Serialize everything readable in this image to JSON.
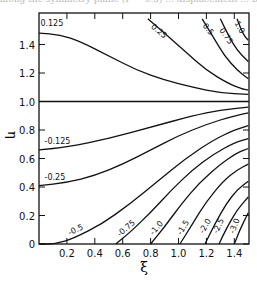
{
  "caption_fragment": "along the symmetry plane (Γ = 0.5) ... displacement ... by",
  "chart_data": {
    "type": "line",
    "title": "",
    "xlabel": "ξ",
    "ylabel": "η",
    "xlim": [
      0,
      1.5
    ],
    "ylim": [
      0,
      1.62
    ],
    "grid": false,
    "legend": "none (inline contour labels)",
    "xticks": [
      0.2,
      0.4,
      0.6,
      0.8,
      1.0,
      1.2,
      1.4
    ],
    "xtick_labels": [
      "0.2",
      "0.4",
      "0.6",
      "0.8",
      "1.0",
      "1.2",
      "1.4"
    ],
    "yticks": [
      0,
      0.2,
      0.4,
      0.6,
      0.8,
      1.0,
      1.2,
      1.4
    ],
    "ytick_labels": [
      "0",
      "0.2",
      "0.4",
      "0.6",
      "0.8",
      "1.0",
      "1.2",
      "1.4"
    ],
    "series": [
      {
        "name": "0.125",
        "points": [
          [
            0,
            1.48
          ],
          [
            0.15,
            1.47
          ],
          [
            0.3,
            1.42
          ],
          [
            0.5,
            1.32
          ],
          [
            0.7,
            1.22
          ],
          [
            0.9,
            1.15
          ],
          [
            1.1,
            1.1
          ],
          [
            1.3,
            1.06
          ],
          [
            1.5,
            1.05
          ]
        ],
        "label_at": [
          0.01,
          1.53
        ],
        "label_rot": 0
      },
      {
        "name": "0.25",
        "points": [
          [
            0.78,
            1.58
          ],
          [
            0.9,
            1.48
          ],
          [
            1.05,
            1.35
          ],
          [
            1.2,
            1.22
          ],
          [
            1.35,
            1.13
          ],
          [
            1.45,
            1.09
          ],
          [
            1.5,
            1.08
          ]
        ],
        "label_at": [
          0.8,
          1.52
        ],
        "label_rot": 40
      },
      {
        "name": "0.5",
        "points": [
          [
            1.17,
            1.58
          ],
          [
            1.25,
            1.45
          ],
          [
            1.33,
            1.32
          ],
          [
            1.42,
            1.22
          ],
          [
            1.5,
            1.16
          ]
        ],
        "label_at": [
          1.17,
          1.53
        ],
        "label_rot": 50
      },
      {
        "name": "0.75",
        "points": [
          [
            1.3,
            1.58
          ],
          [
            1.36,
            1.46
          ],
          [
            1.42,
            1.36
          ],
          [
            1.48,
            1.3
          ],
          [
            1.5,
            1.28
          ]
        ],
        "label_at": [
          1.29,
          1.5
        ],
        "label_rot": 55
      },
      {
        "name": "1.0",
        "points": [
          [
            1.42,
            1.58
          ],
          [
            1.45,
            1.5
          ],
          [
            1.48,
            1.45
          ],
          [
            1.5,
            1.43
          ]
        ],
        "label_at": [
          1.4,
          1.55
        ],
        "label_rot": 60
      },
      {
        "name": "1.0 (η)",
        "points": [
          [
            0,
            1.0
          ],
          [
            1.5,
            1.0
          ]
        ],
        "label_at": null,
        "label_rot": 0
      },
      {
        "name": "-0.125",
        "points": [
          [
            0,
            0.66
          ],
          [
            0.2,
            0.68
          ],
          [
            0.5,
            0.74
          ],
          [
            0.8,
            0.82
          ],
          [
            1.1,
            0.9
          ],
          [
            1.3,
            0.94
          ],
          [
            1.5,
            0.96
          ]
        ],
        "label_at": [
          0.04,
          0.7
        ],
        "label_rot": 0
      },
      {
        "name": "-0.25",
        "points": [
          [
            0,
            0.41
          ],
          [
            0.2,
            0.43
          ],
          [
            0.4,
            0.48
          ],
          [
            0.6,
            0.56
          ],
          [
            0.8,
            0.66
          ],
          [
            1.0,
            0.76
          ],
          [
            1.2,
            0.84
          ],
          [
            1.4,
            0.9
          ],
          [
            1.5,
            0.92
          ]
        ],
        "label_at": [
          0.04,
          0.45
        ],
        "label_rot": 0
      },
      {
        "name": "-0.5",
        "points": [
          [
            0,
            0
          ],
          [
            0.12,
            0.0
          ],
          [
            0.25,
            0.04
          ],
          [
            0.45,
            0.14
          ],
          [
            0.65,
            0.28
          ],
          [
            0.85,
            0.44
          ],
          [
            1.05,
            0.6
          ],
          [
            1.25,
            0.73
          ],
          [
            1.4,
            0.8
          ],
          [
            1.5,
            0.83
          ]
        ],
        "label_at": [
          0.22,
          0.06
        ],
        "label_rot": -25
      },
      {
        "name": "-0.75",
        "points": [
          [
            0.55,
            0
          ],
          [
            0.65,
            0.08
          ],
          [
            0.8,
            0.22
          ],
          [
            0.95,
            0.38
          ],
          [
            1.1,
            0.52
          ],
          [
            1.25,
            0.63
          ],
          [
            1.4,
            0.71
          ],
          [
            1.5,
            0.74
          ]
        ],
        "label_at": [
          0.58,
          0.05
        ],
        "label_rot": -40
      },
      {
        "name": "-1.0",
        "points": [
          [
            0.8,
            0
          ],
          [
            0.9,
            0.12
          ],
          [
            1.02,
            0.28
          ],
          [
            1.15,
            0.43
          ],
          [
            1.3,
            0.56
          ],
          [
            1.42,
            0.64
          ],
          [
            1.5,
            0.67
          ]
        ],
        "label_at": [
          0.82,
          0.06
        ],
        "label_rot": -50
      },
      {
        "name": "-1.5",
        "points": [
          [
            1.01,
            0
          ],
          [
            1.1,
            0.14
          ],
          [
            1.2,
            0.3
          ],
          [
            1.32,
            0.44
          ],
          [
            1.42,
            0.52
          ],
          [
            1.5,
            0.56
          ]
        ],
        "label_at": [
          1.02,
          0.06
        ],
        "label_rot": -58
      },
      {
        "name": "-2.0",
        "points": [
          [
            1.19,
            0
          ],
          [
            1.26,
            0.14
          ],
          [
            1.34,
            0.28
          ],
          [
            1.42,
            0.38
          ],
          [
            1.5,
            0.44
          ]
        ],
        "label_at": [
          1.18,
          0.07
        ],
        "label_rot": -60
      },
      {
        "name": "-2.5",
        "points": [
          [
            1.29,
            0
          ],
          [
            1.35,
            0.12
          ],
          [
            1.42,
            0.24
          ],
          [
            1.5,
            0.33
          ]
        ],
        "label_at": [
          1.28,
          0.07
        ],
        "label_rot": -65
      },
      {
        "name": "-3.0",
        "points": [
          [
            1.4,
            0
          ],
          [
            1.44,
            0.1
          ],
          [
            1.48,
            0.18
          ],
          [
            1.5,
            0.22
          ]
        ],
        "label_at": [
          1.4,
          0.07
        ],
        "label_rot": -70
      }
    ]
  }
}
